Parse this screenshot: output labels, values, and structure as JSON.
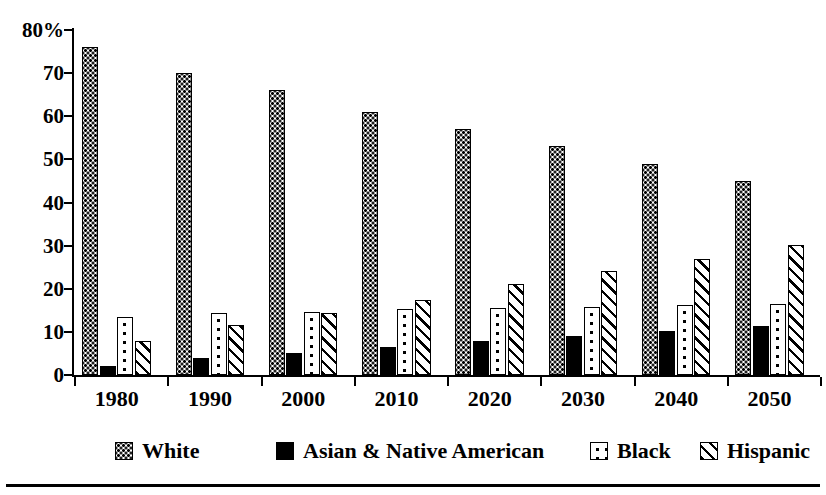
{
  "chart_data": {
    "type": "bar",
    "title": "",
    "subtitle": "",
    "xlabel": "",
    "ylabel": "",
    "grid": false,
    "legend_position": "bottom",
    "ylim": [
      0,
      80
    ],
    "yticks": [
      0,
      10,
      20,
      30,
      40,
      50,
      60,
      70,
      80
    ],
    "ytick_labels": [
      "0",
      "10",
      "20",
      "30",
      "40",
      "50",
      "60",
      "70",
      "80%"
    ],
    "categories": [
      "1980",
      "1990",
      "2000",
      "2010",
      "2020",
      "2030",
      "2040",
      "2050"
    ],
    "series": [
      {
        "name": "White",
        "pattern": "fine-dots",
        "values": [
          76,
          70,
          66,
          61,
          57,
          53,
          49,
          45
        ]
      },
      {
        "name": "Asian & Native American",
        "pattern": "solid-black",
        "values": [
          2,
          4,
          5,
          6.5,
          8,
          9,
          10.3,
          11.3
        ]
      },
      {
        "name": "Black",
        "pattern": "sparse-dots",
        "values": [
          13.5,
          14.3,
          14.5,
          15.2,
          15.5,
          15.7,
          16.2,
          16.5
        ]
      },
      {
        "name": "Hispanic",
        "pattern": "diagonal-hatch",
        "values": [
          8,
          11.6,
          14.3,
          17.5,
          21,
          24.2,
          27,
          30.2
        ]
      }
    ]
  },
  "legend": {
    "items": [
      {
        "label": "White",
        "pattern": "fine-dots"
      },
      {
        "label": "Asian & Native American",
        "pattern": "solid-black"
      },
      {
        "label": "Black",
        "pattern": "sparse-dots"
      },
      {
        "label": "Hispanic",
        "pattern": "diagonal-hatch"
      }
    ]
  },
  "colors": {
    "ink": "#000000",
    "background": "#ffffff"
  }
}
